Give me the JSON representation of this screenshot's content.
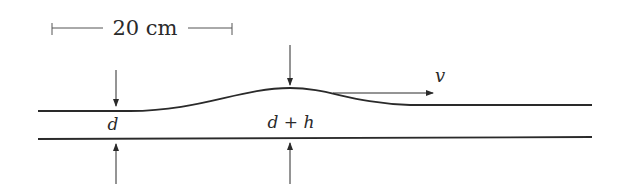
{
  "figure": {
    "scale_bar": {
      "label": "20 cm"
    },
    "labels": {
      "depth": "d",
      "depth_plus_height": "d + h",
      "velocity": "v"
    },
    "colors": {
      "ink": "#2a2a2a",
      "background": "#ffffff"
    }
  }
}
